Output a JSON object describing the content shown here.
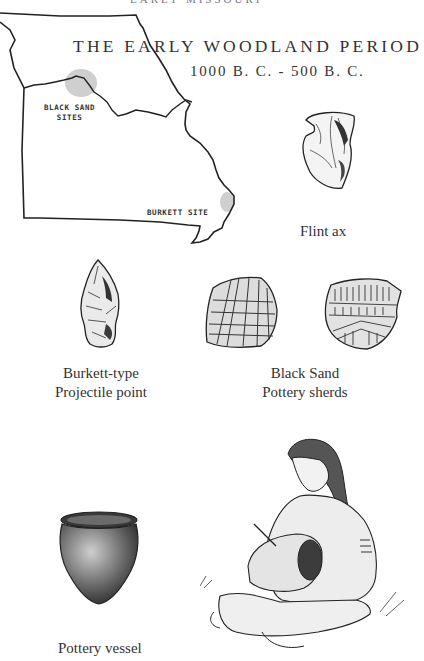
{
  "page": {
    "clipped_header": "EARLY MISSOURI",
    "title": "THE EARLY WOODLAND PERIOD",
    "date_range": "1000 B. C. - 500 B. C."
  },
  "map": {
    "labels": {
      "black_sand_line1": "BLACK SAND",
      "black_sand_line2": "SITES",
      "burkett": "BURKETT SITE"
    }
  },
  "illustrations": {
    "flint_ax": {
      "caption": "Flint ax"
    },
    "projectile_point": {
      "caption_line1": "Burkett-type",
      "caption_line2": "Projectile point"
    },
    "pottery_sherds": {
      "caption_line1": "Black Sand",
      "caption_line2": "Pottery sherds"
    },
    "pottery_vessel": {
      "caption": "Pottery vessel"
    },
    "potter_figure": {
      "caption": ""
    }
  },
  "colors": {
    "ink": "#2a2a2a",
    "shading": "#bdbdbd",
    "paper": "#ffffff"
  }
}
